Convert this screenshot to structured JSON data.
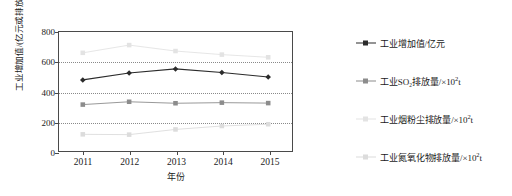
{
  "chart_data": {
    "type": "line",
    "title": "",
    "xlabel": "年份",
    "ylabel": "工业增加值/(亿元或排放量/×10²t)",
    "categories": [
      "2011",
      "2012",
      "2013",
      "2014",
      "2015"
    ],
    "ylim": [
      0,
      800
    ],
    "yticks": [
      0,
      200,
      400,
      600,
      800
    ],
    "ytick_labels": [
      "0",
      "200",
      "400",
      "600",
      "800"
    ],
    "grid": true,
    "legend_position": "right",
    "series": [
      {
        "name": "工业增加值/亿元",
        "marker": "diamond",
        "color": "#2b2b2b",
        "values": [
          478,
          524,
          552,
          528,
          498
        ]
      },
      {
        "name": "工业SO₂排放量/×10²t",
        "marker": "square",
        "color": "#8c8c8c",
        "values": [
          312,
          331,
          321,
          325,
          322
        ]
      },
      {
        "name": "工业烟粉尘排放量/×10²t",
        "marker": "square",
        "color": "#e3e3e3",
        "values": [
          660,
          712,
          672,
          648,
          630
        ]
      },
      {
        "name": "工业氮氧化物排放量/×10²t",
        "marker": "square",
        "color": "#dcdcdc",
        "values": [
          112,
          110,
          145,
          168,
          180
        ]
      }
    ]
  },
  "legend": {
    "items": [
      {
        "label_prefix": "工业增加值/亿元",
        "label_sup": "",
        "label_suffix": ""
      },
      {
        "label_prefix": "工业SO₂排放量/×10",
        "label_sup": "2",
        "label_suffix": "t"
      },
      {
        "label_prefix": "工业烟粉尘排放量/×10",
        "label_sup": "2",
        "label_suffix": "t"
      },
      {
        "label_prefix": "工业氮氧化物排放量/×10",
        "label_sup": "2",
        "label_suffix": "t"
      }
    ]
  },
  "axis": {
    "ylabel_prefix": "工业增加值/(亿元或排放量/×10",
    "ylabel_sup": "2",
    "ylabel_suffix": "t)",
    "xlabel": "年份"
  },
  "caption": ""
}
